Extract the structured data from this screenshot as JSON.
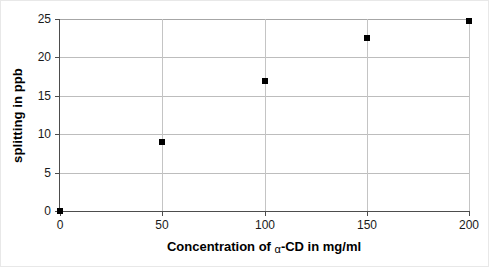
{
  "chart_data": {
    "type": "scatter",
    "title": "",
    "xlabel_prefix": "Concentration of ",
    "xlabel_symbol": "α",
    "xlabel_suffix": "-CD in mg/ml",
    "xlabel": "Concentration of α-CD in mg/ml",
    "ylabel": "splitting in ppb",
    "x": [
      0,
      50,
      100,
      150,
      200
    ],
    "values": [
      0.0,
      9.0,
      16.9,
      22.5,
      24.8
    ],
    "series": [
      {
        "name": "splitting",
        "marker": "filled-square",
        "color": "#000000",
        "points": [
          {
            "x": 0,
            "y": 0.0
          },
          {
            "x": 50,
            "y": 9.0
          },
          {
            "x": 100,
            "y": 16.9
          },
          {
            "x": 150,
            "y": 22.5
          },
          {
            "x": 200,
            "y": 24.8
          }
        ]
      }
    ],
    "xlim": [
      0,
      200
    ],
    "ylim": [
      0,
      25
    ],
    "xticks": [
      0,
      50,
      100,
      150,
      200
    ],
    "yticks": [
      0,
      5,
      10,
      15,
      20,
      25
    ],
    "xtick_labels": [
      "0",
      "50",
      "100",
      "150",
      "200"
    ],
    "ytick_labels": [
      "0",
      "5",
      "10",
      "15",
      "20",
      "25"
    ],
    "grid": "horizontal-and-vertical",
    "grid_color": "#bdbdbd",
    "legend": "none",
    "legend_position": "none",
    "axis_color": "#4d4d4d",
    "background": "#ffffff"
  }
}
